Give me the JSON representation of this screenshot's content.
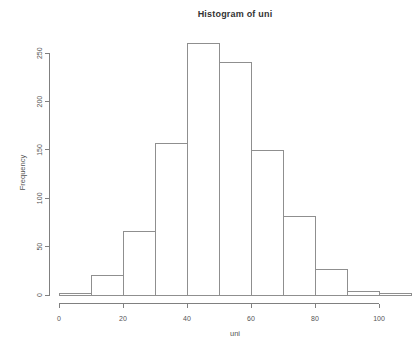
{
  "chart_data": {
    "type": "bar",
    "subtype": "histogram",
    "title": "Histogram of uni",
    "xlabel": "uni",
    "ylabel": "Frequency",
    "bin_edges": [
      0,
      10,
      20,
      30,
      40,
      50,
      60,
      70,
      80,
      90,
      100,
      110
    ],
    "counts": [
      2,
      20,
      66,
      157,
      260,
      240,
      149,
      81,
      26,
      4,
      2
    ],
    "x_ticks": [
      0,
      20,
      40,
      60,
      80,
      100
    ],
    "y_ticks": [
      0,
      50,
      100,
      150,
      200,
      250
    ],
    "xlim": [
      0,
      110
    ],
    "ylim": [
      0,
      260
    ],
    "grid": false,
    "legend": "none",
    "colors": {
      "background": "#ffffff",
      "bar_fill": "#ffffff",
      "bar_border": "#8f8f8f",
      "axis": "#808080",
      "tick_text": "#555555",
      "title_text": "#333333"
    }
  }
}
